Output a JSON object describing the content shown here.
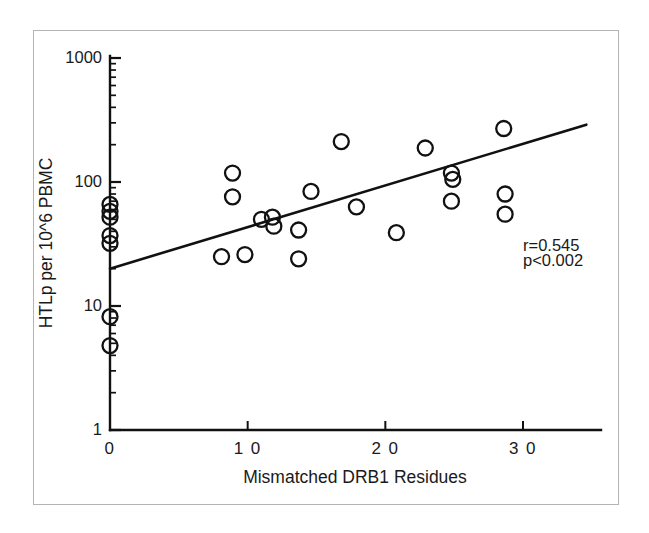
{
  "figure": {
    "background_color": "#ffffff",
    "frame_color": "#b4b4b4",
    "ink_color": "#111111"
  },
  "chart_data": {
    "type": "scatter",
    "title": "",
    "subtitle": "",
    "xlabel": "Mismatched DRB1 Residues",
    "ylabel": "HTLp per 10^6 PBMC",
    "xscale": "linear",
    "yscale": "log",
    "xlim": [
      0,
      34.8
    ],
    "ylim": [
      1,
      1000
    ],
    "xticks": [
      0,
      10,
      20,
      30
    ],
    "xticklabels": [
      "0",
      "1 0",
      "2 0",
      "3 0"
    ],
    "yticks": [
      1,
      10,
      100,
      1000
    ],
    "yticklabels": [
      "1",
      "10",
      "100",
      "1000"
    ],
    "y_minor_ticks": [
      2,
      3,
      4,
      5,
      6,
      7,
      8,
      9,
      20,
      30,
      40,
      50,
      60,
      70,
      80,
      90,
      200,
      300,
      400,
      500,
      600,
      700,
      800,
      900
    ],
    "grid": false,
    "legend": null,
    "marker": {
      "shape": "circle-open",
      "radius_px": 7.5,
      "edge_color": "#111111",
      "fill": "none"
    },
    "series": [
      {
        "name": "HTLp frequency",
        "points": [
          {
            "x": 0.0,
            "y": 66
          },
          {
            "x": 0.0,
            "y": 58
          },
          {
            "x": 0.0,
            "y": 52
          },
          {
            "x": 0.0,
            "y": 37
          },
          {
            "x": 0.0,
            "y": 32
          },
          {
            "x": 0.0,
            "y": 8.2
          },
          {
            "x": 0.0,
            "y": 4.8
          },
          {
            "x": 8.1,
            "y": 25
          },
          {
            "x": 8.9,
            "y": 118
          },
          {
            "x": 8.9,
            "y": 76
          },
          {
            "x": 9.8,
            "y": 26
          },
          {
            "x": 11.0,
            "y": 50
          },
          {
            "x": 11.8,
            "y": 52
          },
          {
            "x": 11.9,
            "y": 44
          },
          {
            "x": 13.7,
            "y": 41
          },
          {
            "x": 13.7,
            "y": 24
          },
          {
            "x": 14.6,
            "y": 84
          },
          {
            "x": 16.8,
            "y": 212
          },
          {
            "x": 17.9,
            "y": 63
          },
          {
            "x": 20.8,
            "y": 39
          },
          {
            "x": 22.9,
            "y": 188
          },
          {
            "x": 24.8,
            "y": 118
          },
          {
            "x": 24.9,
            "y": 105
          },
          {
            "x": 24.8,
            "y": 70
          },
          {
            "x": 28.6,
            "y": 270
          },
          {
            "x": 28.7,
            "y": 80
          },
          {
            "x": 28.7,
            "y": 55
          }
        ]
      }
    ],
    "regression_line": {
      "x_start": 0.0,
      "y_start": 20.0,
      "x_end": 34.6,
      "y_end": 290.0
    },
    "annotations": [
      {
        "id": "correlation",
        "text": "r=0.545",
        "x": 30.0,
        "y": 30.0
      },
      {
        "id": "pvalue",
        "text": "p<0.002",
        "x": 30.0,
        "y": 23.0
      }
    ]
  }
}
